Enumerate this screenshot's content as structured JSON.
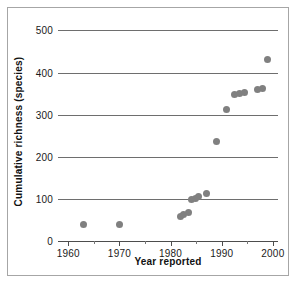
{
  "chart_data": {
    "type": "scatter",
    "title": "",
    "xlabel": "Year reported",
    "ylabel": "Cumulative richness (species)",
    "xlim": [
      1958,
      2001
    ],
    "ylim": [
      0,
      520
    ],
    "grid": true,
    "legend": false,
    "marker_color": "#808080",
    "x_ticks": [
      1960,
      1970,
      1980,
      1990,
      2000
    ],
    "x_tick_labels": [
      "1960",
      "1970",
      "1980",
      "1990",
      "2000"
    ],
    "x_minor_ticks": [
      1965,
      1975,
      1985,
      1995
    ],
    "y_ticks": [
      0,
      100,
      200,
      300,
      400,
      500
    ],
    "y_tick_labels": [
      "0",
      "100",
      "200",
      "300",
      "400",
      "500"
    ],
    "y_gridlines": [
      100,
      200,
      300,
      400,
      500
    ],
    "series": [
      {
        "name": "Cumulative richness",
        "x": [
          1963,
          1970,
          1982,
          1982.6,
          1983.5,
          1984,
          1984.8,
          1985.4,
          1987,
          1989,
          1991,
          1992.5,
          1993.5,
          1994.5,
          1997,
          1998,
          1999
        ],
        "y": [
          40,
          40,
          58,
          62,
          68,
          98,
          100,
          105,
          112,
          237,
          312,
          348,
          350,
          352,
          360,
          363,
          430
        ]
      }
    ]
  }
}
